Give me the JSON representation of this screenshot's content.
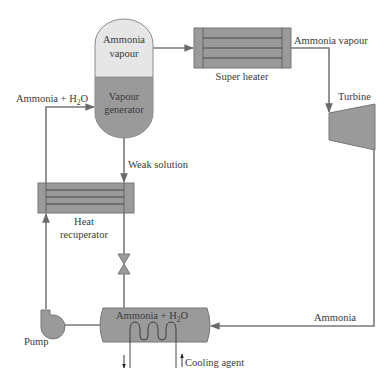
{
  "diagram": {
    "type": "process-flow",
    "components": {
      "vapour_generator": {
        "top_label_line1": "Ammonia",
        "top_label_line2": "vapour",
        "bottom_label_line1": "Vapour",
        "bottom_label_line2": "generator"
      },
      "super_heater": {
        "label": "Super heater"
      },
      "turbine": {
        "label": "Turbine"
      },
      "heat_recuperator": {
        "label_line1": "Heat",
        "label_line2": "recuperator"
      },
      "absorber": {
        "label_main": "Ammonia + H",
        "label_sub": "2",
        "label_tail": "O"
      },
      "pump": {
        "label": "Pump"
      },
      "expansion_valve": {
        "label": ""
      }
    },
    "flows": {
      "ammonia_vapour_out": "Ammonia vapour",
      "ammonia_h2o_in_prefix": "Ammonia + H",
      "ammonia_h2o_in_sub": "2",
      "ammonia_h2o_in_tail": "O",
      "weak_solution": "Weak solution",
      "ammonia_return": "Ammonia",
      "cooling_agent": "Cooling agent"
    },
    "colors": {
      "vessel_dark": "#9a9a9a",
      "vessel_light": "#e6e6e6",
      "pipe": "#7a7a7a",
      "text": "#3a3a3a"
    }
  }
}
